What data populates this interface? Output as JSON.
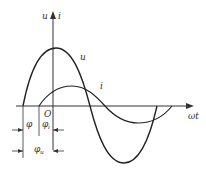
{
  "diagram": {
    "type": "phase-difference sinusoid plot",
    "axes": {
      "y_label_u": "u",
      "y_label_sep": "▲",
      "y_label_i": "i",
      "x_label": "ωt",
      "origin": "O"
    },
    "curves": [
      {
        "name": "u",
        "label": "u",
        "amplitude": "large"
      },
      {
        "name": "i",
        "label": "i",
        "amplitude": "small"
      }
    ],
    "annotations": {
      "phi": "φ",
      "phi_i": "φ",
      "phi_i_sub": "i",
      "phi_u": "φ",
      "phi_u_sub": "u"
    }
  }
}
